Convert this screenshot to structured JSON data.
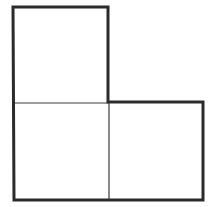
{
  "diagram": {
    "type": "polyomino",
    "shape": "L-tromino",
    "cell_count": 3,
    "cells": [
      {
        "row": 0,
        "col": 0
      },
      {
        "row": 1,
        "col": 0
      },
      {
        "row": 1,
        "col": 1
      }
    ],
    "colors": {
      "background": "#ffffff",
      "outline": "#2b2b2b",
      "divider": "#3a3a3a"
    },
    "geometry": {
      "outline_points": "13,7 108,7 108,102 203,102 203,200 14,200",
      "outline_width": 3,
      "dividers": [
        {
          "x1": 14,
          "y1": 103,
          "x2": 108,
          "y2": 103
        },
        {
          "x1": 109,
          "y1": 103,
          "x2": 109,
          "y2": 200
        }
      ],
      "divider_width": 1.2
    }
  }
}
